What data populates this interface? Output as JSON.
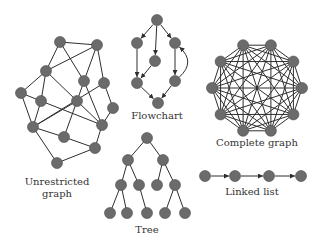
{
  "colors": {
    "node": "#6b6b6b",
    "edge": "#2e2e2e",
    "label": "#333333",
    "background": "#ffffff"
  },
  "node_radius": 5.5,
  "diagrams": [
    {
      "id": "unrestricted",
      "label_lines": [
        "Unrestricted",
        "graph"
      ],
      "label_pos": [
        57,
        185
      ],
      "directed": false,
      "nodes": [
        [
          60,
          42
        ],
        [
          97,
          45
        ],
        [
          46,
          71
        ],
        [
          84,
          81
        ],
        [
          104,
          83
        ],
        [
          21,
          93
        ],
        [
          41,
          101
        ],
        [
          77,
          101
        ],
        [
          113,
          108
        ],
        [
          33,
          127
        ],
        [
          102,
          125
        ],
        [
          64,
          137
        ],
        [
          95,
          148
        ],
        [
          57,
          163
        ]
      ],
      "edges": [
        [
          0,
          1
        ],
        [
          0,
          2
        ],
        [
          0,
          3
        ],
        [
          1,
          2
        ],
        [
          1,
          3
        ],
        [
          1,
          4
        ],
        [
          2,
          5
        ],
        [
          2,
          6
        ],
        [
          2,
          7
        ],
        [
          3,
          7
        ],
        [
          3,
          10
        ],
        [
          4,
          8
        ],
        [
          4,
          9
        ],
        [
          5,
          6
        ],
        [
          5,
          9
        ],
        [
          6,
          9
        ],
        [
          6,
          10
        ],
        [
          7,
          10
        ],
        [
          7,
          11
        ],
        [
          8,
          10
        ],
        [
          9,
          11
        ],
        [
          9,
          13
        ],
        [
          11,
          12
        ],
        [
          10,
          12
        ],
        [
          12,
          13
        ],
        [
          7,
          9
        ]
      ]
    },
    {
      "id": "flowchart",
      "label_lines": [
        "Flowchart"
      ],
      "label_pos": [
        157,
        119
      ],
      "directed": true,
      "nodes": [
        [
          157,
          20
        ],
        [
          137,
          43
        ],
        [
          155,
          61
        ],
        [
          175,
          43
        ],
        [
          137,
          83
        ],
        [
          175,
          81
        ],
        [
          158,
          103
        ]
      ],
      "edges": [
        [
          0,
          1
        ],
        [
          0,
          2
        ],
        [
          0,
          3
        ],
        [
          1,
          4
        ],
        [
          2,
          4
        ],
        [
          3,
          5
        ],
        [
          4,
          6
        ],
        [
          5,
          6
        ]
      ],
      "curved_edges": [
        {
          "from": 5,
          "to": 3,
          "control": [
            196,
            62
          ]
        }
      ]
    },
    {
      "id": "complete",
      "label_lines": [
        "Complete graph"
      ],
      "label_pos": [
        257,
        146
      ],
      "directed": false,
      "complete": true,
      "center": [
        257,
        88
      ],
      "radius": 45,
      "count": 10
    },
    {
      "id": "tree",
      "label_lines": [
        "Tree"
      ],
      "label_pos": [
        147,
        233
      ],
      "directed": false,
      "nodes": [
        [
          147,
          138
        ],
        [
          128,
          160
        ],
        [
          163,
          160
        ],
        [
          121,
          185
        ],
        [
          139,
          185
        ],
        [
          157,
          185
        ],
        [
          175,
          185
        ],
        [
          110,
          213
        ],
        [
          127,
          213
        ],
        [
          147,
          213
        ],
        [
          165,
          213
        ],
        [
          185,
          213
        ]
      ],
      "edges": [
        [
          0,
          1
        ],
        [
          0,
          2
        ],
        [
          1,
          3
        ],
        [
          1,
          4
        ],
        [
          2,
          5
        ],
        [
          2,
          6
        ],
        [
          3,
          7
        ],
        [
          3,
          8
        ],
        [
          4,
          9
        ],
        [
          6,
          10
        ],
        [
          6,
          11
        ]
      ]
    },
    {
      "id": "linked-list",
      "label_lines": [
        "Linked list"
      ],
      "label_pos": [
        252,
        195
      ],
      "directed": true,
      "nodes": [
        [
          205,
          176
        ],
        [
          235,
          176
        ],
        [
          269,
          176
        ],
        [
          301,
          176
        ]
      ],
      "edges": [
        [
          0,
          1
        ],
        [
          1,
          2
        ],
        [
          2,
          3
        ]
      ]
    }
  ]
}
